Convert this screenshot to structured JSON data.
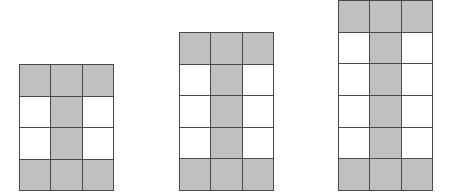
{
  "diagram": {
    "type": "pattern-sequence",
    "colors": {
      "shaded": "#c0c0c0",
      "unshaded": "#ffffff",
      "grid_line": "#4a4a4a"
    },
    "figures": [
      {
        "index": 1,
        "cols": 3,
        "rows": 4,
        "position": {
          "x": 19,
          "y": 64,
          "width": 95,
          "height": 127
        },
        "shaded_cells": 8,
        "grid": [
          [
            1,
            1,
            1
          ],
          [
            0,
            1,
            0
          ],
          [
            0,
            1,
            0
          ],
          [
            1,
            1,
            1
          ]
        ]
      },
      {
        "index": 2,
        "cols": 3,
        "rows": 5,
        "position": {
          "x": 179,
          "y": 32,
          "width": 95,
          "height": 159
        },
        "shaded_cells": 9,
        "grid": [
          [
            1,
            1,
            1
          ],
          [
            0,
            1,
            0
          ],
          [
            0,
            1,
            0
          ],
          [
            0,
            1,
            0
          ],
          [
            1,
            1,
            1
          ]
        ]
      },
      {
        "index": 3,
        "cols": 3,
        "rows": 6,
        "position": {
          "x": 338,
          "y": 0,
          "width": 95,
          "height": 191
        },
        "shaded_cells": 10,
        "grid": [
          [
            1,
            1,
            1
          ],
          [
            0,
            1,
            0
          ],
          [
            0,
            1,
            0
          ],
          [
            0,
            1,
            0
          ],
          [
            0,
            1,
            0
          ],
          [
            1,
            1,
            1
          ]
        ]
      }
    ]
  }
}
